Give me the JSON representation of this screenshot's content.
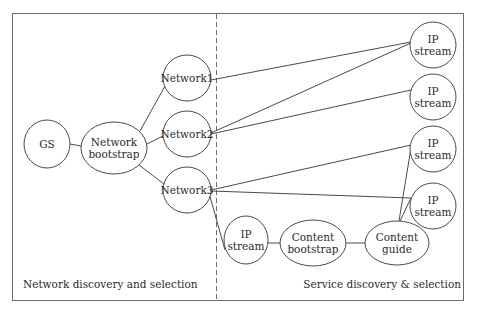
{
  "regions": {
    "left_label": "Network discovery and selection",
    "right_label": "Service discovery & selection"
  },
  "colors": {
    "stroke": "#4a4a4a",
    "text": "#2a2a2a",
    "background": "#ffffff"
  },
  "nodes": [
    {
      "id": "gs",
      "lines": [
        "GS"
      ],
      "cx": 47,
      "cy": 144,
      "rx": 23,
      "ry": 24
    },
    {
      "id": "network-bootstrap",
      "lines": [
        "Network",
        "bootstrap"
      ],
      "cx": 114,
      "cy": 148,
      "rx": 33,
      "ry": 26
    },
    {
      "id": "network1",
      "lines": [
        "Network1"
      ],
      "cx": 187,
      "cy": 78,
      "rx": 24,
      "ry": 23
    },
    {
      "id": "network2",
      "lines": [
        "Network2"
      ],
      "cx": 187,
      "cy": 134,
      "rx": 24,
      "ry": 23
    },
    {
      "id": "network3",
      "lines": [
        "Network3"
      ],
      "cx": 187,
      "cy": 190,
      "rx": 24,
      "ry": 23
    },
    {
      "id": "ip-stream-1",
      "lines": [
        "IP",
        "stream"
      ],
      "cx": 433,
      "cy": 45,
      "rx": 23,
      "ry": 23
    },
    {
      "id": "ip-stream-2",
      "lines": [
        "IP",
        "stream"
      ],
      "cx": 433,
      "cy": 97,
      "rx": 23,
      "ry": 23
    },
    {
      "id": "ip-stream-3",
      "lines": [
        "IP",
        "stream"
      ],
      "cx": 433,
      "cy": 149,
      "rx": 23,
      "ry": 23
    },
    {
      "id": "ip-stream-4",
      "lines": [
        "IP",
        "stream"
      ],
      "cx": 433,
      "cy": 206,
      "rx": 23,
      "ry": 23
    },
    {
      "id": "ip-stream-5",
      "lines": [
        "IP",
        "stream"
      ],
      "cx": 246,
      "cy": 240,
      "rx": 22,
      "ry": 24
    },
    {
      "id": "content-bootstrap",
      "lines": [
        "Content",
        "bootstrap"
      ],
      "cx": 313,
      "cy": 243,
      "rx": 33,
      "ry": 23
    },
    {
      "id": "content-guide",
      "lines": [
        "Content",
        "guide"
      ],
      "cx": 397,
      "cy": 243,
      "rx": 32,
      "ry": 22
    }
  ],
  "edges": [
    {
      "from": "gs",
      "to": "network-bootstrap",
      "x1": 70,
      "y1": 144,
      "x2": 81,
      "y2": 146
    },
    {
      "from": "network-bootstrap",
      "to": "network1",
      "x1": 140,
      "y1": 131,
      "x2": 165,
      "y2": 86
    },
    {
      "from": "network-bootstrap",
      "to": "network2",
      "x1": 147,
      "y1": 144,
      "x2": 163,
      "y2": 136
    },
    {
      "from": "network-bootstrap",
      "to": "network3",
      "x1": 139,
      "y1": 165,
      "x2": 164,
      "y2": 184
    },
    {
      "from": "network1",
      "to": "ip-stream-1",
      "x1": 211,
      "y1": 80,
      "x2": 411,
      "y2": 42
    },
    {
      "from": "network2",
      "to": "ip-stream-1",
      "x1": 211,
      "y1": 133,
      "x2": 411,
      "y2": 43
    },
    {
      "from": "network2",
      "to": "ip-stream-2",
      "x1": 211,
      "y1": 134,
      "x2": 411,
      "y2": 90
    },
    {
      "from": "network3",
      "to": "ip-stream-3",
      "x1": 211,
      "y1": 190,
      "x2": 411,
      "y2": 145
    },
    {
      "from": "network3",
      "to": "ip-stream-4",
      "x1": 211,
      "y1": 191,
      "x2": 411,
      "y2": 198
    },
    {
      "from": "network3",
      "to": "ip-stream-5",
      "x1": 209,
      "y1": 193,
      "x2": 225,
      "y2": 250
    },
    {
      "from": "ip-stream-5",
      "to": "content-bootstrap",
      "x1": 268,
      "y1": 243,
      "x2": 280,
      "y2": 243
    },
    {
      "from": "content-bootstrap",
      "to": "content-guide",
      "x1": 346,
      "y1": 243,
      "x2": 365,
      "y2": 243
    },
    {
      "from": "content-guide",
      "to": "ip-stream-3",
      "x1": 399,
      "y1": 221,
      "x2": 411,
      "y2": 148
    },
    {
      "from": "content-guide",
      "to": "ip-stream-4",
      "x1": 400,
      "y1": 221,
      "x2": 411,
      "y2": 198
    }
  ]
}
